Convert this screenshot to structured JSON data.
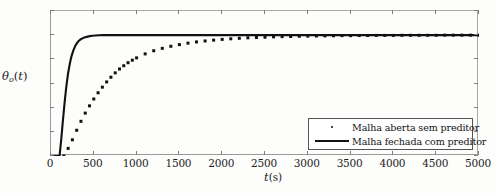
{
  "chart_data": {
    "type": "line",
    "title": "",
    "xlabel": "t(s)",
    "ylabel": "θo(t)",
    "xlim": [
      0,
      5000
    ],
    "ylim": [
      0,
      1.2
    ],
    "grid": false,
    "legend_position": "bottom-right",
    "x_ticks": [
      0,
      500,
      1000,
      1500,
      2000,
      2500,
      3000,
      3500,
      4000,
      4500,
      5000
    ],
    "x_tick_labels": [
      "0",
      "500",
      "1000",
      "1500",
      "2000",
      "2500",
      "3000",
      "3500",
      "4000",
      "4500",
      "5000"
    ],
    "y_ticks": [
      0,
      0.2,
      0.4,
      0.6,
      0.8,
      1.0,
      1.2
    ],
    "y_tick_labels": [
      "0",
      "0,2",
      "0,4",
      "0,6",
      "0,8",
      "1",
      "1,2"
    ],
    "series": [
      {
        "name": "Malha aberta sem preditor",
        "style": "dotted",
        "color": "#111111",
        "x": [
          0,
          50,
          100,
          150,
          200,
          250,
          300,
          350,
          400,
          450,
          500,
          550,
          600,
          650,
          700,
          750,
          800,
          850,
          900,
          950,
          1000,
          1100,
          1200,
          1300,
          1400,
          1500,
          1600,
          1700,
          1800,
          1900,
          2000,
          2100,
          2200,
          2300,
          2400,
          2500,
          2600,
          2700,
          2800,
          2900,
          3000,
          3100,
          3200,
          3300,
          3400,
          3500,
          3600,
          3700,
          3800,
          3900,
          4000,
          4100,
          4200,
          4300,
          4400,
          4500,
          4600,
          4700,
          4800,
          4900,
          5000
        ],
        "y": [
          0,
          0,
          0,
          0.0,
          0.063,
          0.134,
          0.213,
          0.287,
          0.355,
          0.415,
          0.472,
          0.523,
          0.57,
          0.613,
          0.652,
          0.688,
          0.72,
          0.747,
          0.772,
          0.793,
          0.812,
          0.845,
          0.871,
          0.891,
          0.908,
          0.922,
          0.934,
          0.944,
          0.952,
          0.959,
          0.965,
          0.97,
          0.974,
          0.978,
          0.981,
          0.983,
          0.986,
          0.988,
          0.989,
          0.991,
          0.992,
          0.993,
          0.994,
          0.995,
          0.996,
          0.996,
          0.997,
          0.997,
          0.998,
          0.998,
          0.998,
          0.999,
          0.999,
          0.999,
          0.999,
          0.999,
          1.0,
          1.0,
          1.0,
          1.0,
          1.0
        ]
      },
      {
        "name": "Malha fechada com preditor",
        "style": "solid",
        "color": "#111111",
        "x": [
          0,
          40,
          80,
          100,
          120,
          140,
          160,
          180,
          200,
          220,
          240,
          260,
          280,
          300,
          320,
          340,
          360,
          380,
          400,
          440,
          480,
          520,
          560,
          600,
          700,
          800,
          1000,
          1500,
          2000,
          2500,
          3000,
          3500,
          4000,
          4500,
          5000
        ],
        "y": [
          0,
          0,
          0,
          0.0,
          0.14,
          0.3,
          0.45,
          0.58,
          0.685,
          0.765,
          0.827,
          0.872,
          0.906,
          0.931,
          0.949,
          0.962,
          0.971,
          0.978,
          0.983,
          0.99,
          0.995,
          0.997,
          0.999,
          1.0,
          1.0,
          1.0,
          1.0,
          1.0,
          1.0,
          1.0,
          1.0,
          1.0,
          1.0,
          1.0,
          1.0
        ]
      }
    ],
    "annotations": []
  },
  "axes": {
    "y_title_symbol": "θ",
    "y_title_subscript": "o",
    "y_title_suffix": "(t)",
    "x_title_symbol": "t",
    "x_title_unit": "(s)"
  },
  "legend": {
    "entries": [
      {
        "label": "Malha aberta sem preditor",
        "marker": "dot"
      },
      {
        "label": "Malha fechada com preditor",
        "marker": "line"
      }
    ]
  }
}
